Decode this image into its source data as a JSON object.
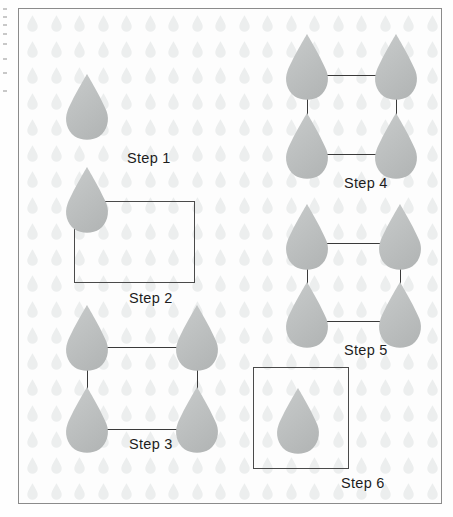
{
  "figure": {
    "type": "diagram",
    "frame_border_color": "#8b8b8b",
    "background_color": "#fdfdfd"
  },
  "palette": {
    "droplet_fill": "#b9bcbc",
    "droplet_fill_light": "#c9cccc",
    "droplet_pattern": "#eceeee",
    "line_color": "#3a3a3a",
    "box_color": "#4a4a4a",
    "label_color": "#1d1d1d"
  },
  "wallpaper": {
    "icon_name": "water-droplet-icon",
    "columns": 18,
    "rows": 19,
    "spacing_x": 23.5,
    "spacing_y": 26
  },
  "steps": [
    {
      "id": "step-1",
      "label": "Step 1",
      "label_x": 108,
      "label_y": 141,
      "droplets": [
        {
          "x": 42,
          "y": 64,
          "size": "normal"
        }
      ],
      "connectors": [],
      "boxes": []
    },
    {
      "id": "step-2",
      "label": "Step 2",
      "label_x": 110,
      "label_y": 281,
      "droplets": [
        {
          "x": 42,
          "y": 157,
          "size": "normal"
        }
      ],
      "connectors": [],
      "boxes": [
        {
          "x": 55,
          "y": 192,
          "w": 121,
          "h": 82
        }
      ]
    },
    {
      "id": "step-3",
      "label": "Step 3",
      "label_x": 110,
      "label_y": 427,
      "droplets": [
        {
          "x": 42,
          "y": 295,
          "size": "normal"
        },
        {
          "x": 152,
          "y": 295,
          "size": "normal"
        },
        {
          "x": 42,
          "y": 377,
          "size": "normal"
        },
        {
          "x": 152,
          "y": 377,
          "size": "normal"
        }
      ],
      "connectors": [
        {
          "dir": "h",
          "x": 68,
          "y": 338,
          "len": 110
        },
        {
          "dir": "v",
          "x": 68,
          "y": 338,
          "len": 82
        },
        {
          "dir": "v",
          "x": 178,
          "y": 338,
          "len": 82
        },
        {
          "dir": "h",
          "x": 68,
          "y": 420,
          "len": 110
        }
      ],
      "boxes": []
    },
    {
      "id": "step-4",
      "label": "Step 4",
      "label_x": 325,
      "label_y": 166,
      "droplets": [
        {
          "x": 262,
          "y": 24,
          "size": "normal"
        },
        {
          "x": 351,
          "y": 24,
          "size": "normal"
        },
        {
          "x": 262,
          "y": 103,
          "size": "normal"
        },
        {
          "x": 351,
          "y": 103,
          "size": "normal"
        }
      ],
      "connectors": [
        {
          "dir": "h",
          "x": 288,
          "y": 66,
          "len": 89
        },
        {
          "dir": "v",
          "x": 288,
          "y": 66,
          "len": 79
        },
        {
          "dir": "v",
          "x": 377,
          "y": 66,
          "len": 79
        },
        {
          "dir": "h",
          "x": 288,
          "y": 145,
          "len": 89
        }
      ],
      "boxes": []
    },
    {
      "id": "step-5",
      "label": "Step 5",
      "label_x": 325,
      "label_y": 333,
      "droplets": [
        {
          "x": 262,
          "y": 194,
          "size": "normal"
        },
        {
          "x": 355,
          "y": 194,
          "size": "normal"
        },
        {
          "x": 262,
          "y": 272,
          "size": "normal"
        },
        {
          "x": 355,
          "y": 272,
          "size": "normal"
        }
      ],
      "connectors": [
        {
          "dir": "h",
          "x": 288,
          "y": 234,
          "len": 93
        },
        {
          "dir": "v",
          "x": 288,
          "y": 234,
          "len": 78
        },
        {
          "dir": "v",
          "x": 381,
          "y": 234,
          "len": 78
        },
        {
          "dir": "h",
          "x": 288,
          "y": 312,
          "len": 93
        }
      ],
      "boxes": []
    },
    {
      "id": "step-6",
      "label": "Step 6",
      "label_x": 322,
      "label_y": 466,
      "droplets": [
        {
          "x": 253,
          "y": 378,
          "size": "normal"
        }
      ],
      "connectors": [],
      "boxes": [
        {
          "x": 234,
          "y": 358,
          "w": 96,
          "h": 102
        }
      ]
    }
  ],
  "margin_marks": [
    {
      "y": 8
    },
    {
      "y": 16
    },
    {
      "y": 24
    },
    {
      "y": 33
    },
    {
      "y": 43
    },
    {
      "y": 58
    },
    {
      "y": 72
    },
    {
      "y": 90
    }
  ]
}
